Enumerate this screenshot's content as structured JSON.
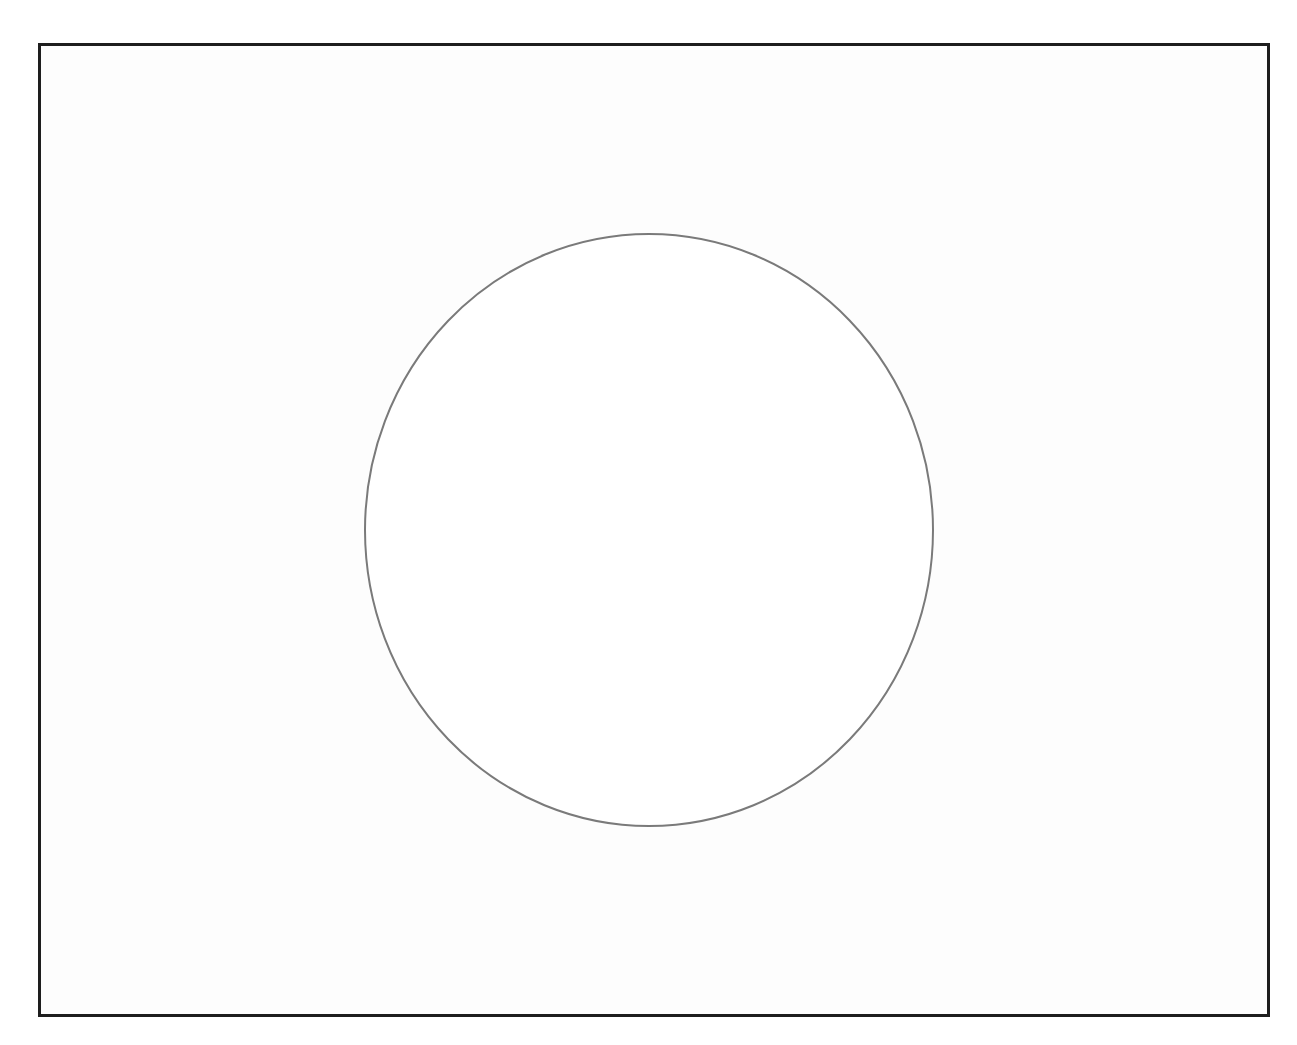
{
  "page": {
    "cutoff_text": "",
    "background": "#ffffff"
  },
  "frame": {
    "border_color": "#1e1e1e",
    "fill": "#fdfdfd"
  },
  "figure": {
    "shape": "circle",
    "stroke_color": "#7a7a7a",
    "fill": "#ffffff",
    "center": [
      649,
      530
    ],
    "radius_x": 284,
    "radius_y": 296
  }
}
